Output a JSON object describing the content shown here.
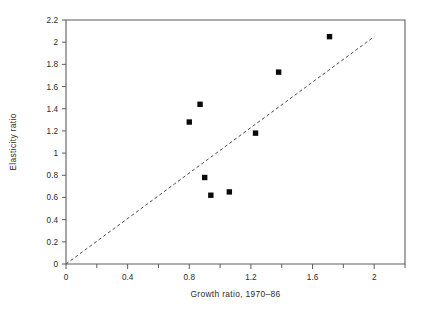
{
  "chart_data": {
    "type": "scatter",
    "title": "",
    "xlabel": "Growth ratio, 1970–86",
    "ylabel": "Elasticity ratio",
    "xlim": [
      0,
      2.2
    ],
    "ylim": [
      0,
      2.2
    ],
    "grid": false,
    "legend": null,
    "xticks": [
      0,
      0.4,
      0.8,
      1.2,
      1.6,
      2
    ],
    "xtick_labels": [
      "0",
      "0.4",
      "0.8",
      "1.2",
      "1.6",
      "2"
    ],
    "x_minor_ticks": [
      0.2,
      0.6,
      1.0,
      1.4,
      1.8,
      2.2
    ],
    "yticks": [
      0,
      0.2,
      0.4,
      0.6,
      0.8,
      1,
      1.2,
      1.4,
      1.6,
      1.8,
      2,
      2.2
    ],
    "ytick_labels": [
      "0",
      "0.2",
      "0.4",
      "0.6",
      "0.8",
      "1",
      "1.2",
      "1.4",
      "1.6",
      "1.8",
      "2",
      "2.2"
    ],
    "series": [
      {
        "name": "observations",
        "marker": "filled-square",
        "color": "#0a0a0a",
        "points": [
          {
            "x": 0.8,
            "y": 1.28
          },
          {
            "x": 0.87,
            "y": 1.44
          },
          {
            "x": 0.9,
            "y": 0.78
          },
          {
            "x": 0.94,
            "y": 0.62
          },
          {
            "x": 1.06,
            "y": 0.65
          },
          {
            "x": 1.23,
            "y": 1.18
          },
          {
            "x": 1.38,
            "y": 1.73
          },
          {
            "x": 1.71,
            "y": 2.05
          }
        ]
      }
    ],
    "annotations": [
      {
        "name": "reference-line",
        "type": "line",
        "style": "dashed",
        "color": "#4a4a4a",
        "from": {
          "x": 0,
          "y": 0
        },
        "to": {
          "x": 2.0,
          "y": 2.05
        }
      }
    ]
  }
}
